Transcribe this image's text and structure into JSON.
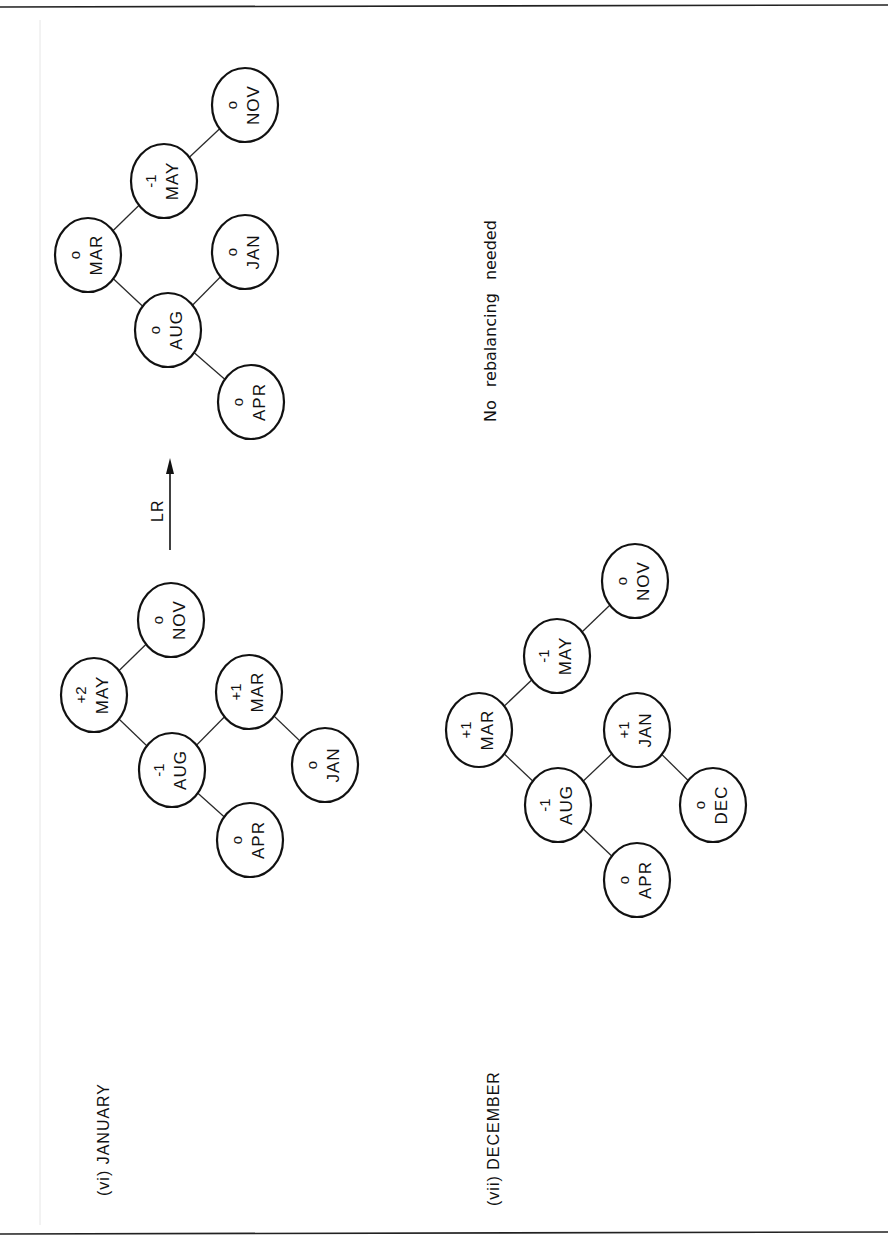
{
  "page": {
    "orientation": "rotated-90-ccw"
  },
  "sections": [
    {
      "id": "vi",
      "label": "(vi) JANUARY",
      "before_tree": {
        "nodes": [
          {
            "key": "MAY",
            "balance": "+2",
            "cx": 94,
            "cy": 695
          },
          {
            "key": "AUG",
            "balance": "-1",
            "cx": 172,
            "cy": 770
          },
          {
            "key": "NOV",
            "balance": "0",
            "cx": 171,
            "cy": 620
          },
          {
            "key": "APR",
            "balance": "0",
            "cx": 250,
            "cy": 840
          },
          {
            "key": "MAR",
            "balance": "+1",
            "cx": 249,
            "cy": 692
          },
          {
            "key": "JAN",
            "balance": "0",
            "cx": 325,
            "cy": 765
          }
        ],
        "edges": [
          [
            "MAY",
            "AUG"
          ],
          [
            "MAY",
            "NOV"
          ],
          [
            "AUG",
            "APR"
          ],
          [
            "AUG",
            "MAR"
          ],
          [
            "MAR",
            "JAN"
          ]
        ]
      },
      "rotation": {
        "label": "LR"
      },
      "after_tree": {
        "nodes": [
          {
            "key": "MAR",
            "balance": "0",
            "cx": 88,
            "cy": 255
          },
          {
            "key": "AUG",
            "balance": "0",
            "cx": 168,
            "cy": 330
          },
          {
            "key": "MAY",
            "balance": "-1",
            "cx": 164,
            "cy": 181
          },
          {
            "key": "APR",
            "balance": "0",
            "cx": 251,
            "cy": 402
          },
          {
            "key": "JAN",
            "balance": "0",
            "cx": 245,
            "cy": 252
          },
          {
            "key": "NOV",
            "balance": "0",
            "cx": 245,
            "cy": 105
          }
        ],
        "edges": [
          [
            "MAR",
            "AUG"
          ],
          [
            "MAR",
            "MAY"
          ],
          [
            "AUG",
            "APR"
          ],
          [
            "AUG",
            "JAN"
          ],
          [
            "MAY",
            "NOV"
          ]
        ]
      }
    },
    {
      "id": "vii",
      "label": "(vii) DECEMBER",
      "note": "No rebalancing needed",
      "tree": {
        "nodes": [
          {
            "key": "MAR",
            "balance": "+1",
            "cx": 479,
            "cy": 730
          },
          {
            "key": "AUG",
            "balance": "-1",
            "cx": 558,
            "cy": 805
          },
          {
            "key": "MAY",
            "balance": "-1",
            "cx": 557,
            "cy": 656
          },
          {
            "key": "APR",
            "balance": "0",
            "cx": 637,
            "cy": 880
          },
          {
            "key": "JAN",
            "balance": "+1",
            "cx": 637,
            "cy": 730
          },
          {
            "key": "DEC",
            "balance": "0",
            "cx": 713,
            "cy": 805
          },
          {
            "key": "NOV",
            "balance": "0",
            "cx": 635,
            "cy": 581
          }
        ],
        "edges": [
          [
            "MAR",
            "AUG"
          ],
          [
            "MAR",
            "MAY"
          ],
          [
            "AUG",
            "APR"
          ],
          [
            "AUG",
            "JAN"
          ],
          [
            "JAN",
            "DEC"
          ],
          [
            "MAY",
            "NOV"
          ]
        ]
      }
    }
  ],
  "colors": {
    "ink": "#111111",
    "paper": "#ffffff"
  }
}
